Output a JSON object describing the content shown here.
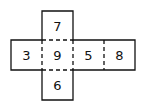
{
  "diagram": {
    "type": "cube-net",
    "faces": {
      "top": "7",
      "left": "3",
      "center": "9",
      "right": "5",
      "far_right": "8",
      "bottom": "6"
    },
    "colors": {
      "line": "#111111",
      "background": "#ffffff"
    }
  }
}
